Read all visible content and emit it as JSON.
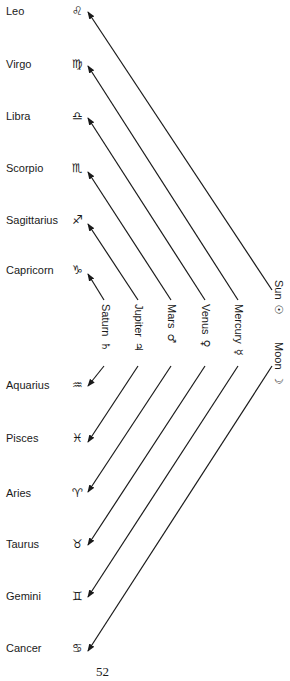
{
  "signs": [
    {
      "name": "Leo",
      "glyph": "♌"
    },
    {
      "name": "Virgo",
      "glyph": "♍"
    },
    {
      "name": "Libra",
      "glyph": "♎"
    },
    {
      "name": "Scorpio",
      "glyph": "♏"
    },
    {
      "name": "Sagittarius",
      "glyph": "♐"
    },
    {
      "name": "Capricorn",
      "glyph": "♑"
    },
    {
      "name": "Aquarius",
      "glyph": "♒"
    },
    {
      "name": "Pisces",
      "glyph": "♓"
    },
    {
      "name": "Aries",
      "glyph": "♈"
    },
    {
      "name": "Taurus",
      "glyph": "♉"
    },
    {
      "name": "Gemini",
      "glyph": "♊"
    },
    {
      "name": "Cancer",
      "glyph": "♋"
    }
  ],
  "planets": [
    {
      "name": "Saturn",
      "glyph": "♄"
    },
    {
      "name": "Jupiter",
      "glyph": "♃"
    },
    {
      "name": "Mars",
      "glyph": "♂"
    },
    {
      "name": "Venus",
      "glyph": "♀"
    },
    {
      "name": "Mercury",
      "glyph": "☿"
    },
    {
      "name": "Sun",
      "glyph": "☉"
    },
    {
      "name": "Moon",
      "glyph": "☽"
    }
  ],
  "page_number": "52",
  "colors": {
    "line": "#1a1a1a",
    "text": "#1a1a1a",
    "background": "#ffffff"
  }
}
